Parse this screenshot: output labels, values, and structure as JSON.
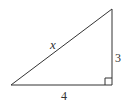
{
  "diagram": {
    "type": "right-triangle",
    "stroke_color": "#333333",
    "labels": {
      "hypotenuse": "x",
      "vertical_leg": "3",
      "horizontal_leg": "4"
    },
    "vertices": {
      "left": [
        11,
        85
      ],
      "right_angle": [
        112,
        85
      ],
      "top": [
        112,
        9
      ]
    },
    "right_angle_marker": true
  }
}
